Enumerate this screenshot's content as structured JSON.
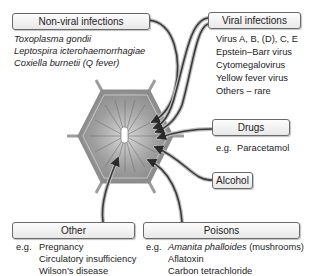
{
  "diagram": {
    "center": {
      "label": "",
      "icon": "liver-lobule-hexagon-icon"
    },
    "categories": [
      {
        "id": "non_viral",
        "label": "Non-viral infections",
        "items": [
          "Toxoplasma gondii",
          "Leptospira icterohaemorrhagiae",
          "Coxiella burnetii (Q fever)"
        ]
      },
      {
        "id": "viral",
        "label": "Viral infections",
        "items": [
          "Virus A, B, (D), C, E",
          "Epstein–Barr virus",
          "Cytomegalovirus",
          "Yellow fever virus",
          "Others – rare"
        ]
      },
      {
        "id": "drugs",
        "label": "Drugs",
        "eg": "e.g.",
        "items": [
          "Paracetamol"
        ]
      },
      {
        "id": "alcohol",
        "label": "Alcohol",
        "items": []
      },
      {
        "id": "other",
        "label": "Other",
        "eg": "e.g.",
        "items": [
          "Pregnancy",
          "Circulatory insufficiency",
          "Wilson’s disease"
        ]
      },
      {
        "id": "poisons",
        "label": "Poisons",
        "eg": "e.g.",
        "items": [
          "Amanita phalloides",
          "(mushrooms)",
          "Aflatoxin",
          "Carbon tetrachloride"
        ]
      }
    ]
  },
  "colors": {
    "box_border": "#6a6a6a",
    "arrow": "#3a3a3a",
    "hexagon_fill": "#9a9a9a",
    "text": "#222222"
  }
}
